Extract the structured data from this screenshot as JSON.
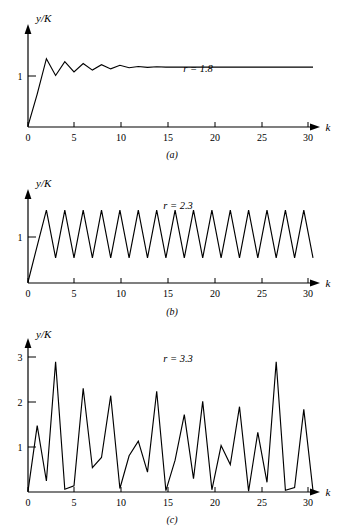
{
  "figure": {
    "ylabel": "y/K",
    "xlabel": "k",
    "panels": [
      {
        "caption": "(a)",
        "annotation": "r = 1.8",
        "y_ticks": [
          "1"
        ],
        "x_ticks": [
          "0",
          "5",
          "10",
          "15",
          "20",
          "25",
          "30"
        ]
      },
      {
        "caption": "(b)",
        "annotation": "r = 2.3",
        "y_ticks": [
          "1"
        ],
        "x_ticks": [
          "0",
          "5",
          "10",
          "15",
          "20",
          "25",
          "30"
        ]
      },
      {
        "caption": "(c)",
        "annotation": "r = 3.3",
        "y_ticks": [
          "1",
          "2",
          "3"
        ],
        "x_ticks": [
          "0",
          "5",
          "10",
          "15",
          "20",
          "25",
          "30"
        ]
      }
    ]
  },
  "chart_data": [
    {
      "type": "line",
      "title": "",
      "annotation": "r = 1.8",
      "caption": "(a)",
      "xlabel": "k",
      "ylabel": "y/K",
      "xlim": [
        0,
        31
      ],
      "ylim": [
        0,
        1.62
      ],
      "xticks": [
        0,
        5,
        10,
        15,
        20,
        25,
        30
      ],
      "yticks": [
        1
      ],
      "grid": false,
      "legend": null,
      "x": [
        0,
        1,
        2,
        3,
        4,
        5,
        6,
        7,
        8,
        9,
        10,
        11,
        12,
        13,
        14,
        15,
        16,
        17,
        18,
        19,
        20,
        21,
        22,
        23,
        24,
        25,
        26,
        27,
        28,
        29,
        30,
        31
      ],
      "values": [
        0.02,
        0.55,
        1.14,
        0.86,
        1.09,
        0.92,
        1.06,
        0.95,
        1.04,
        0.97,
        1.03,
        0.99,
        1.01,
        0.995,
        1.005,
        1.0,
        1.0,
        1.0,
        1.0,
        1.0,
        1.0,
        1.0,
        1.0,
        1.0,
        1.0,
        1.0,
        1.0,
        1.0,
        1.0,
        1.0,
        1.0,
        1.0
      ]
    },
    {
      "type": "line",
      "title": "",
      "annotation": "r = 2.3",
      "caption": "(b)",
      "xlabel": "k",
      "ylabel": "y/K",
      "xlim": [
        0,
        31
      ],
      "ylim": [
        0,
        1.75
      ],
      "xticks": [
        0,
        5,
        10,
        15,
        20,
        25,
        30
      ],
      "yticks": [
        1
      ],
      "grid": false,
      "legend": null,
      "x": [
        0,
        1,
        2,
        3,
        4,
        5,
        6,
        7,
        8,
        9,
        10,
        11,
        12,
        13,
        14,
        15,
        16,
        17,
        18,
        19,
        20,
        21,
        22,
        23,
        24,
        25,
        26,
        27,
        28,
        29,
        30,
        31
      ],
      "values": [
        0.02,
        0.74,
        1.45,
        0.5,
        1.45,
        0.5,
        1.45,
        0.5,
        1.45,
        0.5,
        1.45,
        0.5,
        1.45,
        0.5,
        1.45,
        0.5,
        1.45,
        0.5,
        1.45,
        0.5,
        1.45,
        0.5,
        1.45,
        0.5,
        1.45,
        0.5,
        1.45,
        0.5,
        1.45,
        0.5,
        1.45,
        0.5
      ]
    },
    {
      "type": "line",
      "title": "",
      "annotation": "r = 3.3",
      "caption": "(c)",
      "xlabel": "k",
      "ylabel": "y/K",
      "xlim": [
        0,
        31
      ],
      "ylim": [
        0,
        3.35
      ],
      "xticks": [
        0,
        5,
        10,
        15,
        20,
        25,
        30
      ],
      "yticks": [
        1,
        2,
        3
      ],
      "grid": false,
      "legend": null,
      "x": [
        0,
        1,
        2,
        3,
        4,
        5,
        6,
        7,
        8,
        9,
        10,
        11,
        12,
        13,
        14,
        15,
        16,
        17,
        18,
        19,
        20,
        21,
        22,
        23,
        24,
        25,
        26,
        27,
        28,
        29,
        30,
        31
      ],
      "values": [
        0.02,
        1.5,
        0.25,
        2.95,
        0.06,
        0.14,
        2.35,
        0.55,
        0.78,
        2.18,
        0.08,
        0.82,
        1.15,
        0.45,
        2.28,
        0.03,
        0.72,
        1.75,
        0.3,
        2.05,
        0.05,
        1.05,
        0.62,
        1.93,
        0.02,
        1.35,
        0.22,
        2.95,
        0.04,
        0.1,
        1.87,
        0.03
      ]
    }
  ]
}
